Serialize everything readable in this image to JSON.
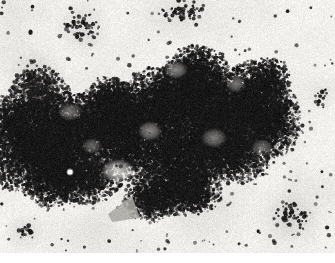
{
  "image": {
    "kind": "electron-micrograph",
    "subject": "immunogold-labelled chromatin mass",
    "width": 335,
    "height": 263,
    "content_top": 0,
    "content_bottom": 253,
    "bottom_margin_height": 10,
    "palette": {
      "background": "#f2f1ee",
      "paper_white": "#ffffff",
      "mid_gray": "#b9b7b2",
      "dark_gray": "#6d6b68",
      "mass_dark": "#2d2c2b",
      "mass_darkest": "#1b1a19",
      "particle": "#191818",
      "highlight_spot": "#fbfbf9"
    },
    "noise": {
      "seed": 20240517,
      "grain_amount": 26,
      "grain_density": 0.55
    },
    "main_mass": {
      "label": "central chromatin aggregate",
      "blobs": [
        {
          "cx": 30,
          "cy": 150,
          "rx": 46,
          "ry": 44,
          "density": 0.93
        },
        {
          "cx": 62,
          "cy": 137,
          "rx": 44,
          "ry": 44,
          "density": 0.95
        },
        {
          "cx": 40,
          "cy": 96,
          "rx": 30,
          "ry": 27,
          "density": 0.8
        },
        {
          "cx": 96,
          "cy": 125,
          "rx": 40,
          "ry": 34,
          "density": 0.92
        },
        {
          "cx": 128,
          "cy": 118,
          "rx": 38,
          "ry": 34,
          "density": 0.94
        },
        {
          "cx": 160,
          "cy": 108,
          "rx": 42,
          "ry": 40,
          "density": 0.96
        },
        {
          "cx": 190,
          "cy": 100,
          "rx": 40,
          "ry": 42,
          "density": 0.95
        },
        {
          "cx": 196,
          "cy": 72,
          "rx": 32,
          "ry": 26,
          "density": 0.88
        },
        {
          "cx": 224,
          "cy": 112,
          "rx": 38,
          "ry": 44,
          "density": 0.93
        },
        {
          "cx": 252,
          "cy": 104,
          "rx": 34,
          "ry": 42,
          "density": 0.9
        },
        {
          "cx": 272,
          "cy": 120,
          "rx": 28,
          "ry": 38,
          "density": 0.86
        },
        {
          "cx": 236,
          "cy": 150,
          "rx": 40,
          "ry": 32,
          "density": 0.88
        },
        {
          "cx": 200,
          "cy": 152,
          "rx": 36,
          "ry": 30,
          "density": 0.86
        },
        {
          "cx": 168,
          "cy": 152,
          "rx": 34,
          "ry": 30,
          "density": 0.88
        },
        {
          "cx": 128,
          "cy": 152,
          "rx": 32,
          "ry": 28,
          "density": 0.84
        },
        {
          "cx": 172,
          "cy": 188,
          "rx": 36,
          "ry": 28,
          "density": 0.88
        },
        {
          "cx": 150,
          "cy": 200,
          "rx": 26,
          "ry": 22,
          "density": 0.82
        },
        {
          "cx": 196,
          "cy": 190,
          "rx": 26,
          "ry": 24,
          "density": 0.8
        },
        {
          "cx": 84,
          "cy": 176,
          "rx": 38,
          "ry": 28,
          "density": 0.86
        },
        {
          "cx": 54,
          "cy": 180,
          "rx": 32,
          "ry": 26,
          "density": 0.84
        },
        {
          "cx": 268,
          "cy": 78,
          "rx": 22,
          "ry": 20,
          "density": 0.76
        },
        {
          "cx": 110,
          "cy": 96,
          "rx": 24,
          "ry": 20,
          "density": 0.72
        },
        {
          "cx": 14,
          "cy": 120,
          "rx": 22,
          "ry": 26,
          "density": 0.8
        }
      ],
      "light_lacunae": [
        {
          "cx": 118,
          "cy": 171,
          "rx": 17,
          "ry": 12,
          "strength": 0.82
        },
        {
          "cx": 150,
          "cy": 131,
          "rx": 12,
          "ry": 10,
          "strength": 0.52
        },
        {
          "cx": 214,
          "cy": 138,
          "rx": 13,
          "ry": 10,
          "strength": 0.46
        },
        {
          "cx": 236,
          "cy": 84,
          "rx": 10,
          "ry": 9,
          "strength": 0.44
        },
        {
          "cx": 176,
          "cy": 70,
          "rx": 12,
          "ry": 9,
          "strength": 0.5
        },
        {
          "cx": 92,
          "cy": 146,
          "rx": 10,
          "ry": 8,
          "strength": 0.36
        },
        {
          "cx": 262,
          "cy": 148,
          "rx": 11,
          "ry": 9,
          "strength": 0.4
        },
        {
          "cx": 70,
          "cy": 112,
          "rx": 12,
          "ry": 9,
          "strength": 0.42
        }
      ]
    },
    "satellite_clusters": [
      {
        "name": "upper-left-cluster",
        "cx": 82,
        "cy": 28,
        "rx": 20,
        "ry": 15,
        "count": 46
      },
      {
        "name": "top-center-cluster",
        "cx": 181,
        "cy": 11,
        "rx": 26,
        "ry": 11,
        "count": 52
      },
      {
        "name": "left-mid-cluster",
        "cx": 36,
        "cy": 78,
        "rx": 20,
        "ry": 18,
        "count": 44
      },
      {
        "name": "lower-right-cluster",
        "cx": 291,
        "cy": 216,
        "rx": 18,
        "ry": 14,
        "count": 48
      },
      {
        "name": "right-edge-cluster",
        "cx": 322,
        "cy": 96,
        "rx": 9,
        "ry": 10,
        "count": 14
      },
      {
        "name": "lower-left-small-cluster",
        "cx": 24,
        "cy": 232,
        "rx": 14,
        "ry": 9,
        "count": 18
      }
    ],
    "scattered_particles_count": 260,
    "features": [
      {
        "name": "white-highlight-spot",
        "cx": 70,
        "cy": 172,
        "r": 2.6,
        "color": "#fbfbf9"
      },
      {
        "name": "gray-wedge",
        "points": "108,214 132,196 140,218 112,222",
        "color": "#a8a6a1"
      }
    ]
  }
}
